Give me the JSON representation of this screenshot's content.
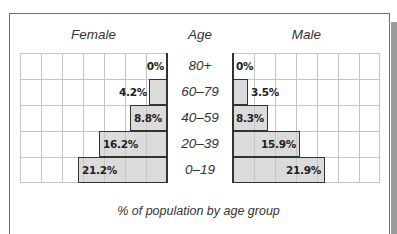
{
  "chart_data": {
    "type": "bar",
    "subtype": "population-pyramid",
    "title": "",
    "caption": "% of population by age group",
    "center_label": "Age",
    "categories": [
      "80+",
      "60–79",
      "40–59",
      "20–39",
      "0–19"
    ],
    "series": [
      {
        "name": "Female",
        "side": "left",
        "values": [
          0,
          4.2,
          8.8,
          16.2,
          21.2
        ],
        "labels": [
          "0%",
          "4.2%",
          "8.8%",
          "16.2%",
          "21.2%"
        ]
      },
      {
        "name": "Male",
        "side": "right",
        "values": [
          0,
          3.5,
          8.3,
          15.9,
          21.9
        ],
        "labels": [
          "0%",
          "3.5%",
          "8.3%",
          "15.9%",
          "21.9%"
        ]
      }
    ],
    "xlabel": "% of population by age group",
    "ylabel": "Age",
    "xlim": [
      0,
      35
    ],
    "grid": true,
    "grid_step": 5,
    "legend": "none (series titles above each half)",
    "colors": {
      "bar_fill": "#d3d3d3",
      "bar_border": "#333333",
      "grid": "#c4c4c4"
    }
  },
  "labels": {
    "female_title": "Female",
    "male_title": "Male",
    "age_title": "Age",
    "caption": "% of population by age group"
  }
}
